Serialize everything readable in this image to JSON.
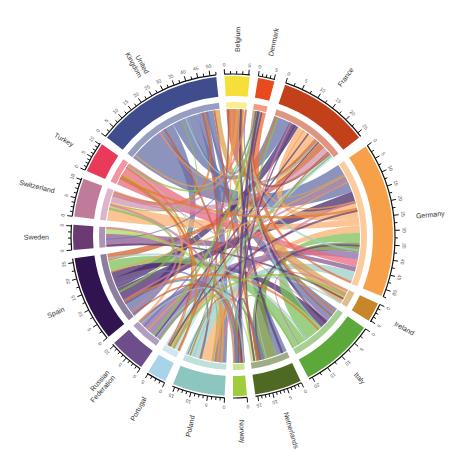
{
  "chart_data": {
    "type": "chord",
    "title": "",
    "center": [
      233,
      236
    ],
    "groups": [
      {
        "name": "Belgium",
        "color": "#f5e03a",
        "start": 357,
        "end": 6,
        "ticks": [
          0,
          5
        ]
      },
      {
        "name": "Denmark",
        "color": "#e84a1e",
        "start": 9,
        "end": 15,
        "ticks": [
          0,
          5
        ]
      },
      {
        "name": "France",
        "color": "#c2401a",
        "start": 19,
        "end": 52,
        "ticks": [
          0,
          5,
          10,
          15,
          20,
          25
        ]
      },
      {
        "name": "Germany",
        "color": "#f7a04a",
        "start": 56,
        "end": 112,
        "ticks": [
          0,
          5,
          10,
          15,
          20,
          25,
          30,
          35,
          40,
          45,
          50
        ]
      },
      {
        "name": "Ireland",
        "color": "#c8862a",
        "start": 115,
        "end": 122,
        "ticks": [
          0,
          5
        ]
      },
      {
        "name": "Italy",
        "color": "#5ca83a",
        "start": 125,
        "end": 152,
        "ticks": [
          0,
          5,
          10,
          15,
          20
        ]
      },
      {
        "name": "Netherlands",
        "color": "#4e6a22",
        "start": 155,
        "end": 172,
        "ticks": [
          0,
          5,
          10,
          15
        ]
      },
      {
        "name": "Norway",
        "color": "#9fcd3e",
        "start": 175,
        "end": 180,
        "ticks": [
          0
        ]
      },
      {
        "name": "Poland",
        "color": "#8cc6be",
        "start": 183,
        "end": 202,
        "ticks": [
          0,
          5,
          10,
          15
        ]
      },
      {
        "name": "Portugal",
        "color": "#a9d3e8",
        "start": 205,
        "end": 212,
        "ticks": [
          0,
          5
        ]
      },
      {
        "name": "Russian Federation",
        "color": "#6e4e8a",
        "start": 215,
        "end": 228,
        "ticks": [
          0,
          5,
          10
        ]
      },
      {
        "name": "Spain",
        "color": "#2f1450",
        "start": 231,
        "end": 262,
        "ticks": [
          0,
          5,
          10,
          15,
          20,
          25
        ]
      },
      {
        "name": "Sweden",
        "color": "#6b3a72",
        "start": 265,
        "end": 274,
        "ticks": [
          0,
          5
        ]
      },
      {
        "name": "Switzerland",
        "color": "#c07a9a",
        "start": 277,
        "end": 291,
        "ticks": [
          0,
          5,
          10
        ]
      },
      {
        "name": "Turkey",
        "color": "#ea3a5a",
        "start": 294,
        "end": 305,
        "ticks": [
          0,
          5,
          10
        ]
      },
      {
        "name": "United Kingdom",
        "color": "#3f4d8e",
        "start": 308,
        "end": 354,
        "ticks": [
          0,
          5,
          10,
          15,
          20,
          25,
          30,
          35,
          40,
          45,
          50
        ]
      }
    ],
    "ribbons": [
      {
        "from": "United Kingdom",
        "to": "Germany",
        "value": 12,
        "color": "#6670a8"
      },
      {
        "from": "United Kingdom",
        "to": "Spain",
        "value": 4,
        "color": "#6670a8"
      },
      {
        "from": "United Kingdom",
        "to": "France",
        "value": 5,
        "color": "#6670a8"
      },
      {
        "from": "United Kingdom",
        "to": "Italy",
        "value": 3,
        "color": "#6670a8"
      },
      {
        "from": "United Kingdom",
        "to": "Poland",
        "value": 3,
        "color": "#6670a8"
      },
      {
        "from": "United Kingdom",
        "to": "Netherlands",
        "value": 2,
        "color": "#6670a8"
      },
      {
        "from": "Spain",
        "to": "Germany",
        "value": 5,
        "color": "#4a2a6a"
      },
      {
        "from": "Spain",
        "to": "France",
        "value": 3,
        "color": "#4a2a6a"
      },
      {
        "from": "Spain",
        "to": "Italy",
        "value": 2,
        "color": "#4a2a6a"
      },
      {
        "from": "Germany",
        "to": "France",
        "value": 6,
        "color": "#f9b070"
      },
      {
        "from": "Germany",
        "to": "Switzerland",
        "value": 3,
        "color": "#f9b070"
      },
      {
        "from": "Germany",
        "to": "Poland",
        "value": 3,
        "color": "#f9b070"
      },
      {
        "from": "Italy",
        "to": "Germany",
        "value": 4,
        "color": "#7cc05a"
      },
      {
        "from": "Italy",
        "to": "Spain",
        "value": 3,
        "color": "#7cc05a"
      },
      {
        "from": "Netherlands",
        "to": "Germany",
        "value": 4,
        "color": "#6f8a3a"
      },
      {
        "from": "France",
        "to": "Belgium",
        "value": 2,
        "color": "#d0602e"
      },
      {
        "from": "France",
        "to": "Spain",
        "value": 2,
        "color": "#d0602e"
      },
      {
        "from": "Russian Federation",
        "to": "Germany",
        "value": 3,
        "color": "#8a6aa8"
      },
      {
        "from": "Turkey",
        "to": "Germany",
        "value": 3,
        "color": "#e86a80"
      },
      {
        "from": "Sweden",
        "to": "Germany",
        "value": 2,
        "color": "#8a5a90"
      },
      {
        "from": "Switzerland",
        "to": "France",
        "value": 2,
        "color": "#d094b0"
      },
      {
        "from": "Poland",
        "to": "Germany",
        "value": 4,
        "color": "#9ccfc8"
      },
      {
        "from": "Portugal",
        "to": "France",
        "value": 2,
        "color": "#b8dcec"
      },
      {
        "from": "Ireland",
        "to": "United Kingdom",
        "value": 2,
        "color": "#d8a050"
      },
      {
        "from": "Belgium",
        "to": "Netherlands",
        "value": 1,
        "color": "#f0e060"
      },
      {
        "from": "Denmark",
        "to": "Germany",
        "value": 1,
        "color": "#ee6a3a"
      },
      {
        "from": "Norway",
        "to": "Sweden",
        "value": 1,
        "color": "#b0d860"
      }
    ]
  }
}
